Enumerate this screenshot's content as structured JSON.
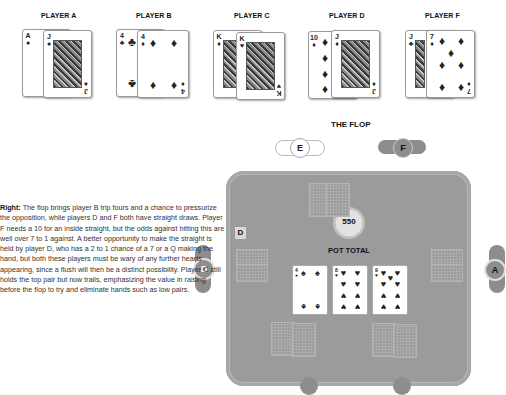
{
  "players": [
    {
      "label": "PLAYER A",
      "cards": [
        {
          "rank": "A",
          "suit": "♠"
        },
        {
          "rank": "J",
          "suit": "♠"
        }
      ]
    },
    {
      "label": "PLAYER B",
      "cards": [
        {
          "rank": "4",
          "suit": "♣"
        },
        {
          "rank": "4",
          "suit": "♦"
        }
      ]
    },
    {
      "label": "PLAYER C",
      "cards": [
        {
          "rank": "K",
          "suit": "♦"
        },
        {
          "rank": "K",
          "suit": "♥"
        }
      ]
    },
    {
      "label": "PLAYER D",
      "cards": [
        {
          "rank": "10",
          "suit": "♦"
        },
        {
          "rank": "J",
          "suit": "♦"
        }
      ]
    },
    {
      "label": "PLAYER F",
      "cards": [
        {
          "rank": "J",
          "suit": "♣"
        },
        {
          "rank": "7",
          "suit": "♦"
        }
      ]
    }
  ],
  "section_title": "THE FLOP",
  "description": {
    "lead": "Right:",
    "body": " The flop brings player B trip fours and a chance to pressurize the opposition, while players D and F both have straight draws. Player F needs a 10 for an inside straight, but the odds against hitting this are well over 7 to 1 against. A better opportunity to make the straight is held by player D, who has a 2 to 1 chance of a 7 or a Q making the hand, but both these players must be wary of any further hearts appearing, since a flush will then be a distinct possibility. Player C still holds the top pair but now trails, emphasizing the value in raising before the flop to try and eliminate hands such as low pairs."
  },
  "table": {
    "pot_amount": "550",
    "pot_label": "POT TOTAL",
    "dealer_marker": "D",
    "flop": [
      {
        "rank": "4",
        "suit": "♠"
      },
      {
        "rank": "8",
        "suit": "♥"
      },
      {
        "rank": "9",
        "suit": "♥"
      }
    ]
  },
  "seats": [
    {
      "id": "E",
      "state": "folded"
    },
    {
      "id": "F",
      "state": "active"
    },
    {
      "id": "D",
      "state": "active"
    },
    {
      "id": "A",
      "state": "active"
    }
  ],
  "colors": {
    "felt": "#9b9b9b",
    "seat_active": "#8d8d8d",
    "seat_folded": "#ffffff",
    "pot_chip": "#d9d9d9"
  }
}
